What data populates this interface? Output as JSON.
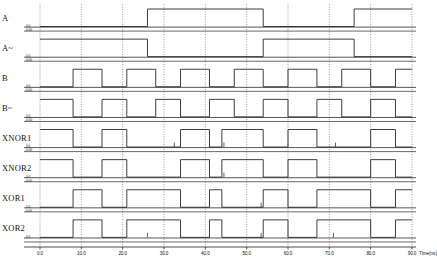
{
  "figure": {
    "type": "timing-waveform",
    "background": "#ffffff",
    "trace_color": "#1c1c1c",
    "grid_color": "#555555"
  },
  "axis": {
    "xlabel": "Time(ns)",
    "xmin": 0.0,
    "xmax": 90.0,
    "xticks": [
      "0.0",
      "10.0",
      "20.0",
      "30.0",
      "40.0",
      "50.0",
      "60.0",
      "70.0",
      "80.0",
      "90.0"
    ],
    "xtick_values": [
      0,
      10,
      20,
      30,
      40,
      50,
      60,
      70,
      80,
      90
    ],
    "grid": "dotted-vertical"
  },
  "voltage_labels": {
    "high": "0.0",
    "low": "-0.00"
  },
  "signals": [
    {
      "name": "A",
      "label": "A",
      "v_high_label": "0.0",
      "v_low_label": "-0.00",
      "transitions": [
        [
          0,
          0
        ],
        [
          26,
          0
        ],
        [
          26,
          1
        ],
        [
          54,
          1
        ],
        [
          54,
          0
        ],
        [
          76,
          0
        ],
        [
          76,
          1
        ],
        [
          90,
          1
        ]
      ]
    },
    {
      "name": "A~",
      "label": "A~",
      "v_high_label": "0.0",
      "v_low_label": "-0.00",
      "transitions": [
        [
          0,
          1
        ],
        [
          26,
          1
        ],
        [
          26,
          0
        ],
        [
          54,
          0
        ],
        [
          54,
          1
        ],
        [
          76,
          1
        ],
        [
          76,
          0
        ],
        [
          90,
          0
        ]
      ]
    },
    {
      "name": "B",
      "label": "B",
      "v_high_label": "0.0",
      "v_low_label": "-0.00",
      "transitions": [
        [
          0,
          0
        ],
        [
          8,
          0
        ],
        [
          8,
          1
        ],
        [
          15,
          1
        ],
        [
          15,
          0
        ],
        [
          21,
          0
        ],
        [
          21,
          1
        ],
        [
          28,
          1
        ],
        [
          28,
          0
        ],
        [
          34,
          0
        ],
        [
          34,
          1
        ],
        [
          41,
          1
        ],
        [
          41,
          0
        ],
        [
          47,
          0
        ],
        [
          47,
          1
        ],
        [
          54,
          1
        ],
        [
          54,
          0
        ],
        [
          60,
          0
        ],
        [
          60,
          1
        ],
        [
          67,
          1
        ],
        [
          67,
          0
        ],
        [
          73,
          0
        ],
        [
          73,
          1
        ],
        [
          80,
          1
        ],
        [
          80,
          0
        ],
        [
          86,
          0
        ],
        [
          86,
          1
        ],
        [
          90,
          1
        ]
      ]
    },
    {
      "name": "B~",
      "label": "B~",
      "v_high_label": "0.0",
      "v_low_label": "-0.00",
      "transitions": [
        [
          0,
          1
        ],
        [
          8,
          1
        ],
        [
          8,
          0
        ],
        [
          15,
          0
        ],
        [
          15,
          1
        ],
        [
          21,
          1
        ],
        [
          21,
          0
        ],
        [
          28,
          0
        ],
        [
          28,
          1
        ],
        [
          34,
          1
        ],
        [
          34,
          0
        ],
        [
          41,
          0
        ],
        [
          41,
          1
        ],
        [
          47,
          1
        ],
        [
          47,
          0
        ],
        [
          54,
          0
        ],
        [
          54,
          1
        ],
        [
          60,
          1
        ],
        [
          60,
          0
        ],
        [
          67,
          0
        ],
        [
          67,
          1
        ],
        [
          73,
          1
        ],
        [
          73,
          0
        ],
        [
          80,
          0
        ],
        [
          80,
          1
        ],
        [
          86,
          1
        ],
        [
          86,
          0
        ],
        [
          90,
          0
        ]
      ]
    },
    {
      "name": "XNOR1",
      "label": "XNOR1",
      "v_high_label": "0.0",
      "v_low_label": "-0.00",
      "transitions": [
        [
          0,
          1
        ],
        [
          8,
          1
        ],
        [
          8,
          0
        ],
        [
          15,
          0
        ],
        [
          15,
          1
        ],
        [
          21,
          1
        ],
        [
          21,
          0
        ],
        [
          34,
          0
        ],
        [
          34,
          1
        ],
        [
          41,
          1
        ],
        [
          41,
          0
        ],
        [
          44,
          0
        ],
        [
          44,
          1
        ],
        [
          54,
          1
        ],
        [
          54,
          0
        ],
        [
          60,
          0
        ],
        [
          60,
          1
        ],
        [
          67,
          1
        ],
        [
          67,
          0
        ],
        [
          80,
          0
        ],
        [
          80,
          1
        ],
        [
          86,
          1
        ],
        [
          86,
          0
        ],
        [
          90,
          0
        ]
      ]
    },
    {
      "name": "XNOR2",
      "label": "XNOR2",
      "v_high_label": "0.0",
      "v_low_label": "-0.00",
      "transitions": [
        [
          0,
          1
        ],
        [
          8,
          1
        ],
        [
          8,
          0
        ],
        [
          15,
          0
        ],
        [
          15,
          1
        ],
        [
          21,
          1
        ],
        [
          21,
          0
        ],
        [
          34,
          0
        ],
        [
          34,
          1
        ],
        [
          41,
          1
        ],
        [
          41,
          0
        ],
        [
          44,
          0
        ],
        [
          44,
          1
        ],
        [
          54,
          1
        ],
        [
          54,
          0
        ],
        [
          60,
          0
        ],
        [
          60,
          1
        ],
        [
          67,
          1
        ],
        [
          67,
          0
        ],
        [
          80,
          0
        ],
        [
          80,
          1
        ],
        [
          86,
          1
        ],
        [
          86,
          0
        ],
        [
          90,
          0
        ]
      ]
    },
    {
      "name": "XOR1",
      "label": "XOR1",
      "v_high_label": "0.0",
      "v_low_label": "-0.00",
      "transitions": [
        [
          0,
          0
        ],
        [
          8,
          0
        ],
        [
          8,
          1
        ],
        [
          15,
          1
        ],
        [
          15,
          0
        ],
        [
          21,
          0
        ],
        [
          21,
          1
        ],
        [
          34,
          1
        ],
        [
          34,
          0
        ],
        [
          41,
          0
        ],
        [
          41,
          1
        ],
        [
          44,
          1
        ],
        [
          44,
          0
        ],
        [
          54,
          0
        ],
        [
          54,
          1
        ],
        [
          60,
          1
        ],
        [
          60,
          0
        ],
        [
          67,
          0
        ],
        [
          67,
          1
        ],
        [
          80,
          1
        ],
        [
          80,
          0
        ],
        [
          86,
          0
        ],
        [
          86,
          1
        ],
        [
          90,
          1
        ]
      ]
    },
    {
      "name": "XOR2",
      "label": "XOR2",
      "v_high_label": "0.0",
      "v_low_label": "-0.00",
      "transitions": [
        [
          0,
          0
        ],
        [
          8,
          0
        ],
        [
          8,
          1
        ],
        [
          15,
          1
        ],
        [
          15,
          0
        ],
        [
          21,
          0
        ],
        [
          21,
          1
        ],
        [
          34,
          1
        ],
        [
          34,
          0
        ],
        [
          41,
          0
        ],
        [
          41,
          1
        ],
        [
          44,
          1
        ],
        [
          44,
          0
        ],
        [
          54,
          0
        ],
        [
          54,
          1
        ],
        [
          60,
          1
        ],
        [
          60,
          0
        ],
        [
          67,
          0
        ],
        [
          67,
          1
        ],
        [
          80,
          1
        ],
        [
          80,
          0
        ],
        [
          86,
          0
        ],
        [
          86,
          1
        ],
        [
          90,
          1
        ]
      ]
    }
  ],
  "chart_data": {
    "type": "line",
    "title": "",
    "xlabel": "Time(ns)",
    "ylabel": "",
    "xlim": [
      0.0,
      90.0
    ],
    "grid": true,
    "legend": "none",
    "series": [
      {
        "name": "A",
        "x": [
          0,
          26,
          26,
          54,
          54,
          76,
          76,
          90
        ],
        "values": [
          0,
          0,
          1,
          1,
          0,
          0,
          1,
          1
        ]
      },
      {
        "name": "A~",
        "x": [
          0,
          26,
          26,
          54,
          54,
          76,
          76,
          90
        ],
        "values": [
          1,
          1,
          0,
          0,
          1,
          1,
          0,
          0
        ]
      },
      {
        "name": "B",
        "x": [
          0,
          8,
          8,
          15,
          15,
          21,
          21,
          28,
          28,
          34,
          34,
          41,
          41,
          47,
          47,
          54,
          54,
          60,
          60,
          67,
          67,
          73,
          73,
          80,
          80,
          86,
          86,
          90
        ],
        "values": [
          0,
          0,
          1,
          1,
          0,
          0,
          1,
          1,
          0,
          0,
          1,
          1,
          0,
          0,
          1,
          1,
          0,
          0,
          1,
          1,
          0,
          0,
          1,
          1,
          0,
          0,
          1,
          1
        ]
      },
      {
        "name": "B~",
        "x": [
          0,
          8,
          8,
          15,
          15,
          21,
          21,
          28,
          28,
          34,
          34,
          41,
          41,
          47,
          47,
          54,
          54,
          60,
          60,
          67,
          67,
          73,
          73,
          80,
          80,
          86,
          86,
          90
        ],
        "values": [
          1,
          1,
          0,
          0,
          1,
          1,
          0,
          0,
          1,
          1,
          0,
          0,
          1,
          1,
          0,
          0,
          1,
          1,
          0,
          0,
          1,
          1,
          0,
          0,
          1,
          1,
          0,
          0
        ]
      },
      {
        "name": "XNOR1",
        "x": [
          0,
          8,
          8,
          15,
          15,
          21,
          21,
          34,
          34,
          41,
          41,
          44,
          44,
          54,
          54,
          60,
          60,
          67,
          67,
          80,
          80,
          86,
          86,
          90
        ],
        "values": [
          1,
          1,
          0,
          0,
          1,
          1,
          0,
          0,
          1,
          1,
          0,
          0,
          1,
          1,
          0,
          0,
          1,
          1,
          0,
          0,
          1,
          1,
          0,
          0
        ]
      },
      {
        "name": "XNOR2",
        "x": [
          0,
          8,
          8,
          15,
          15,
          21,
          21,
          34,
          34,
          41,
          41,
          44,
          44,
          54,
          54,
          60,
          60,
          67,
          67,
          80,
          80,
          86,
          86,
          90
        ],
        "values": [
          1,
          1,
          0,
          0,
          1,
          1,
          0,
          0,
          1,
          1,
          0,
          0,
          1,
          1,
          0,
          0,
          1,
          1,
          0,
          0,
          1,
          1,
          0,
          0
        ]
      },
      {
        "name": "XOR1",
        "x": [
          0,
          8,
          8,
          15,
          15,
          21,
          21,
          34,
          34,
          41,
          41,
          44,
          44,
          54,
          54,
          60,
          60,
          67,
          67,
          80,
          80,
          86,
          86,
          90
        ],
        "values": [
          0,
          0,
          1,
          1,
          0,
          0,
          1,
          1,
          0,
          0,
          1,
          1,
          0,
          0,
          1,
          1,
          0,
          0,
          1,
          1,
          0,
          0,
          1,
          1
        ]
      },
      {
        "name": "XOR2",
        "x": [
          0,
          8,
          8,
          15,
          15,
          21,
          21,
          34,
          34,
          41,
          41,
          44,
          44,
          54,
          54,
          60,
          60,
          67,
          67,
          80,
          80,
          86,
          86,
          90
        ],
        "values": [
          0,
          0,
          1,
          1,
          0,
          0,
          1,
          1,
          0,
          0,
          1,
          1,
          0,
          0,
          1,
          1,
          0,
          0,
          1,
          1,
          0,
          0,
          1,
          1
        ]
      }
    ]
  }
}
